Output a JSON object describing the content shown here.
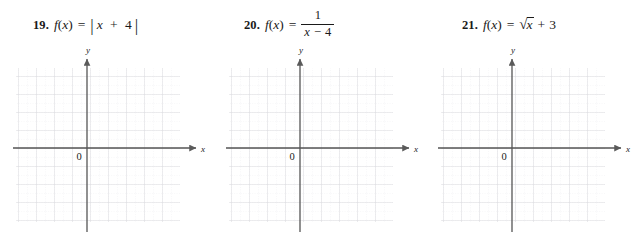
{
  "page": {
    "background": "#ffffff",
    "ink": "#1a1a1a",
    "axis_color": "#555555",
    "grid_minor_color": "#e9e9ec",
    "grid_major_color": "#d6d6da"
  },
  "problems": [
    {
      "number": "19.",
      "fn_name": "f",
      "fn_var": "x",
      "open_paren": "(",
      "close_paren": ")",
      "equals": "=",
      "expression_type": "absolute-value",
      "expression_text": "| x + 4 |",
      "bar_left": "|",
      "bar_right": "|",
      "inner_var": "x",
      "inner_op": "+",
      "inner_const": "4",
      "graph": {
        "origin_label": "0",
        "x_axis_label": "x",
        "y_axis_label": "y",
        "x_range": [
          -5,
          5
        ],
        "y_range": [
          -4,
          4
        ],
        "grid_cells_x": 10,
        "grid_cells_y": 8,
        "curve_drawn": false
      }
    },
    {
      "number": "20.",
      "fn_name": "f",
      "fn_var": "x",
      "open_paren": "(",
      "close_paren": ")",
      "equals": "=",
      "expression_type": "fraction",
      "expression_text": "1 / (x - 4)",
      "numerator": "1",
      "denominator_var": "x",
      "denominator_op": "−",
      "denominator_const": "4",
      "graph": {
        "origin_label": "0",
        "x_axis_label": "x",
        "y_axis_label": "y",
        "x_range": [
          -5,
          5
        ],
        "y_range": [
          -4,
          4
        ],
        "grid_cells_x": 10,
        "grid_cells_y": 8,
        "curve_drawn": false
      }
    },
    {
      "number": "21.",
      "fn_name": "f",
      "fn_var": "x",
      "open_paren": "(",
      "close_paren": ")",
      "equals": "=",
      "expression_type": "square-root",
      "expression_text": "√x + 3",
      "radical_sign": "√",
      "radicand": "x",
      "outer_op": "+",
      "outer_const": "3",
      "graph": {
        "origin_label": "0",
        "x_axis_label": "x",
        "y_axis_label": "y",
        "x_range": [
          -5,
          5
        ],
        "y_range": [
          -4,
          4
        ],
        "grid_cells_x": 10,
        "grid_cells_y": 8,
        "curve_drawn": false
      }
    }
  ]
}
